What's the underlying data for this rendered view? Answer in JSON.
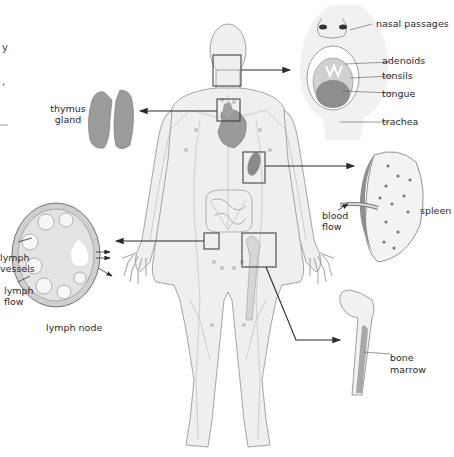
{
  "diagram": {
    "edge_fragments": [
      "y",
      ","
    ],
    "callouts": {
      "head": {
        "labels": [
          "nasal passages",
          "adenoids",
          "tonsils",
          "tongue",
          "trachea"
        ]
      },
      "thymus": {
        "label_line1": "thymus",
        "label_line2": "gland"
      },
      "spleen": {
        "label": "spleen",
        "flow_line1": "blood",
        "flow_line2": "flow"
      },
      "lymph_node": {
        "title": "lymph node",
        "vessels_line1": "lymph",
        "vessels_line2": "vessels",
        "flow_line1": "lymph",
        "flow_line2": "flow"
      },
      "bone": {
        "label_line1": "bone",
        "label_line2": "marrow"
      }
    },
    "colors": {
      "body_fill": "#efefef",
      "body_stroke": "#9a9a9a",
      "organ_fill": "#8f8f8f",
      "organ_light": "#bdbdbd",
      "pointer": "#2b2b2b",
      "background": "#ffffff"
    }
  }
}
